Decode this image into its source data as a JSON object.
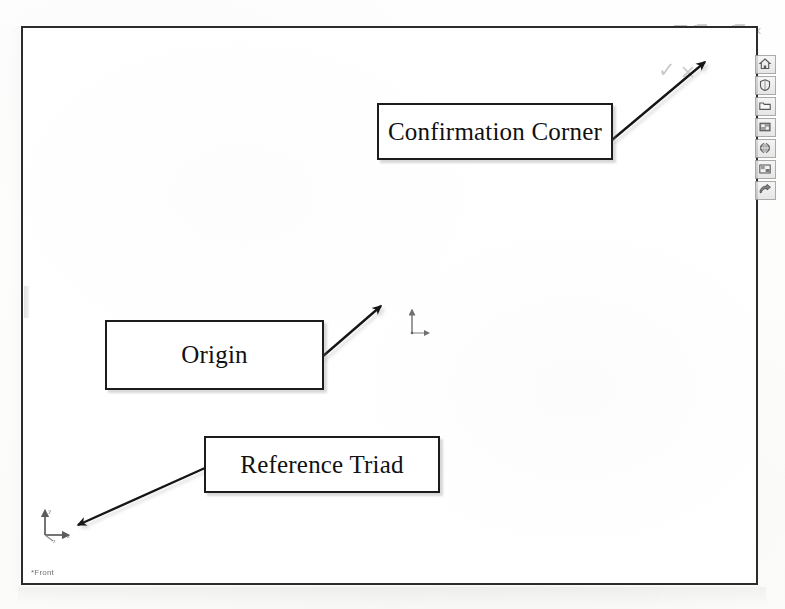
{
  "window": {
    "title": "",
    "status_text": "*Front"
  },
  "toolbar": {
    "icons": [
      {
        "name": "zoom-to-fit-icon",
        "label": "Zoom to Fit"
      },
      {
        "name": "zoom-to-area-icon",
        "label": "Zoom to Area"
      },
      {
        "name": "zoom-in-out-icon",
        "label": "Zoom In/Out"
      },
      {
        "name": "rotate-view-icon",
        "label": "Rotate View"
      },
      {
        "name": "pan-icon",
        "label": "Pan"
      },
      {
        "name": "view-orientation-icon",
        "label": "View Orientation"
      },
      {
        "name": "display-style-icon",
        "label": "Display Style"
      },
      {
        "name": "hide-show-items-icon",
        "label": "Hide/Show Items"
      },
      {
        "name": "edit-appearance-icon",
        "label": "Edit Appearance"
      },
      {
        "name": "apply-scene-icon",
        "label": "Apply Scene"
      },
      {
        "name": "view-settings-icon",
        "label": "View Settings"
      }
    ]
  },
  "window_controls": [
    {
      "name": "restore-window-button",
      "label": "Restore"
    },
    {
      "name": "minimize-window-button",
      "label": "Minimize"
    },
    {
      "name": "maximize-window-button",
      "label": "Maximize"
    },
    {
      "name": "close-window-button",
      "label": "Close"
    }
  ],
  "confirmation_corner": {
    "accept_label": "OK",
    "cancel_label": "Cancel",
    "accept_glyph": "✓",
    "cancel_glyph": "✕"
  },
  "task_pane_rail": [
    {
      "name": "design-library-home-icon",
      "label": "SolidWorks Resources"
    },
    {
      "name": "design-library-icon",
      "label": "Design Library"
    },
    {
      "name": "file-explorer-icon",
      "label": "File Explorer"
    },
    {
      "name": "search-library-icon",
      "label": "Search"
    },
    {
      "name": "view-palette-icon",
      "label": "View Palette"
    },
    {
      "name": "appearances-scenes-icon",
      "label": "Appearances, Scenes and Decals"
    },
    {
      "name": "custom-properties-icon",
      "label": "Custom Properties"
    }
  ],
  "graphics_area": {
    "origin_label": "Origin",
    "triad_axis_x": "x",
    "triad_axis_y": "y",
    "triad_axis_z": "z"
  },
  "callouts": [
    {
      "name": "callout-confirmation-corner",
      "text": "Confirmation Corner",
      "points_to": "confirmation-corner"
    },
    {
      "name": "callout-origin",
      "text": "Origin",
      "points_to": "origin-marker"
    },
    {
      "name": "callout-reference-triad",
      "text": "Reference Triad",
      "points_to": "reference-triad"
    }
  ],
  "colors": {
    "frame_border": "#2c2c2c",
    "callout_border": "#1c1c1c",
    "callout_text": "#111111",
    "arrow": "#141414",
    "canvas_background": "#ffffff",
    "page_background": "#fdfdfc"
  }
}
